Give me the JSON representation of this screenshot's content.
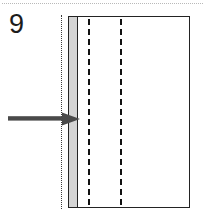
{
  "figure": {
    "number_label": "9",
    "caption": "",
    "background_color": "#ffffff"
  },
  "top_rule": {
    "style": "dotted",
    "color": "#b9b9b9",
    "name": "horizontal-separator"
  },
  "diagram": {
    "outline": {
      "name": "body-rectangle",
      "stroke_color": "#232323",
      "fill_color": "#ffffff",
      "x": 68,
      "y": 16,
      "width": 122,
      "height": 192
    },
    "shaded_band": {
      "name": "shaded-layer",
      "fill_color": "#d4d4d4",
      "stroke_color": "#232323",
      "x": 69,
      "y": 17,
      "width": 8,
      "height": 190
    },
    "dotted_guide": {
      "name": "dotted-guide-line",
      "style": "dotted",
      "color": "#3a3a3a",
      "x": 61
    },
    "dashed_lines": [
      {
        "name": "dashed-line-1",
        "style": "dashed",
        "color": "#111111",
        "x": 88
      },
      {
        "name": "dashed-line-2",
        "style": "dashed",
        "color": "#111111",
        "x": 120
      }
    ],
    "arrow": {
      "name": "pointer-arrow",
      "color": "#4a4a4a",
      "direction": "right",
      "label": "",
      "tail_x": 8,
      "tip_x": 80,
      "y": 119
    }
  },
  "colors": {
    "ink": "#1c1c1c",
    "outline": "#232323",
    "shade": "#d4d4d4",
    "arrow": "#4a4a4a",
    "rule": "#b9b9b9"
  }
}
